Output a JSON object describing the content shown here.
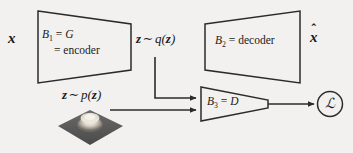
{
  "diagram": {
    "background_color": "#f2f1ef",
    "stroke_color": "#2b2b2b",
    "blocks": [
      {
        "id": "block-1",
        "name": "encoder-block",
        "line1": "B₁ = G",
        "line2": "= encoder",
        "symbol": "B1",
        "equals": "G",
        "role": "encoder",
        "shape": "trapezoid-narrowing-right"
      },
      {
        "id": "block-2",
        "name": "decoder-block",
        "line1": "B₂ = decoder",
        "symbol": "B2",
        "role": "decoder",
        "shape": "trapezoid-widening-right"
      },
      {
        "id": "block-3",
        "name": "discriminator-block",
        "line1": "B₃ = D",
        "symbol": "B3",
        "equals": "D",
        "role": "discriminator",
        "shape": "trapezoid-tapering-to-point"
      }
    ],
    "labels": {
      "input_x": "x",
      "output_xhat": "x̂",
      "latent_posterior": "z ~ q(z)",
      "latent_posterior_parts": {
        "var": "z",
        "tilde": "∼",
        "dist": "q",
        "arg": "(z)"
      },
      "latent_prior": "z ~ p(z)",
      "latent_prior_parts": {
        "var": "z",
        "tilde": "∼",
        "dist": "p",
        "arg": "(z)"
      },
      "loss_symbol": "ℒ"
    },
    "plot": {
      "name": "gaussian-prior-surface",
      "description": "3D surface plot of a Gaussian bump on a dark square plane",
      "plane_color": "#5c5c5c",
      "peak_color": "#e8e4db",
      "type": "surface"
    },
    "connectors": [
      {
        "name": "x-to-encoder",
        "from": "input_x",
        "to": "block-1",
        "arrow": false
      },
      {
        "name": "encoder-to-zq",
        "from": "block-1",
        "to": "latent_posterior",
        "arrow": false
      },
      {
        "name": "zq-to-decoder",
        "from": "latent_posterior",
        "to": "block-2",
        "arrow": false
      },
      {
        "name": "decoder-to-xhat",
        "from": "block-2",
        "to": "output_xhat",
        "arrow": false
      },
      {
        "name": "zq-to-discriminator",
        "from": "latent_posterior",
        "to": "block-3",
        "arrow": true,
        "style": "elbow"
      },
      {
        "name": "zp-to-discriminator",
        "from": "latent_prior",
        "to": "block-3",
        "arrow": true,
        "style": "straight"
      },
      {
        "name": "discriminator-to-loss",
        "from": "block-3",
        "to": "loss_symbol",
        "arrow": true,
        "style": "straight"
      }
    ]
  }
}
